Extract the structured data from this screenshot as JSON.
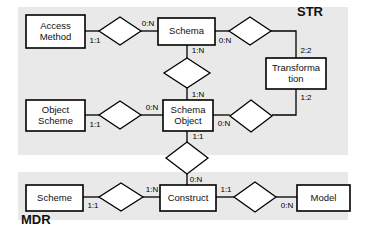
{
  "diagram": {
    "regions": [
      {
        "id": "str",
        "label": "STR",
        "label_x": 297,
        "label_y": 13,
        "x": 18,
        "y": 7,
        "w": 330,
        "h": 148
      },
      {
        "id": "mdr",
        "label": "MDR",
        "label_x": 21,
        "label_y": 221,
        "x": 18,
        "y": 172,
        "w": 330,
        "h": 48
      }
    ],
    "entities": [
      {
        "id": "access-method",
        "lines": [
          "Access",
          "Method"
        ],
        "x": 26,
        "y": 15,
        "w": 59,
        "h": 33
      },
      {
        "id": "schema",
        "lines": [
          "Schema"
        ],
        "x": 158,
        "y": 18,
        "w": 57,
        "h": 27
      },
      {
        "id": "transformation",
        "lines": [
          "Transforma",
          "tion"
        ],
        "x": 266,
        "y": 58,
        "w": 60,
        "h": 31
      },
      {
        "id": "object-scheme",
        "lines": [
          "Object",
          "Scheme"
        ],
        "x": 26,
        "y": 100,
        "w": 59,
        "h": 31
      },
      {
        "id": "schema-object",
        "lines": [
          "Schema",
          "Object"
        ],
        "x": 163,
        "y": 100,
        "w": 50,
        "h": 31
      },
      {
        "id": "scheme",
        "lines": [
          "Scheme"
        ],
        "x": 26,
        "y": 185,
        "w": 57,
        "h": 26
      },
      {
        "id": "construct",
        "lines": [
          "Construct"
        ],
        "x": 160,
        "y": 185,
        "w": 56,
        "h": 26
      },
      {
        "id": "model",
        "lines": [
          "Model"
        ],
        "x": 297,
        "y": 185,
        "w": 53,
        "h": 26
      }
    ],
    "relationships": [
      {
        "id": "access-method-schema",
        "cx": 120,
        "cy": 31,
        "rx": 21,
        "ry": 14
      },
      {
        "id": "schema-transformation",
        "cx": 250,
        "cy": 31,
        "rx": 21,
        "ry": 14
      },
      {
        "id": "schema-schema-object",
        "cx": 187,
        "cy": 73,
        "rx": 23,
        "ry": 15
      },
      {
        "id": "object-scheme-schema-object",
        "cx": 120,
        "cy": 115,
        "rx": 21,
        "ry": 14
      },
      {
        "id": "schema-object-transformation",
        "cx": 251,
        "cy": 116,
        "rx": 21,
        "ry": 16
      },
      {
        "id": "schema-object-construct",
        "cx": 187,
        "cy": 158,
        "rx": 21,
        "ry": 16
      },
      {
        "id": "scheme-construct",
        "cx": 121,
        "cy": 197,
        "rx": 22,
        "ry": 14
      },
      {
        "id": "construct-model",
        "cx": 255,
        "cy": 197,
        "rx": 21,
        "ry": 15
      }
    ],
    "edges": [
      {
        "id": "e-access-method-rel",
        "points": "85,31 99,31"
      },
      {
        "id": "e-rel-schema",
        "points": "141,31 158,31"
      },
      {
        "id": "e-schema-rel-trans",
        "points": "215,31 229,31"
      },
      {
        "id": "e-rel-trans-corner",
        "points": "271,31 296,31 296,58"
      },
      {
        "id": "e-schema-down",
        "points": "187,45 187,58"
      },
      {
        "id": "e-down-schema-object",
        "points": "187,88 187,100"
      },
      {
        "id": "e-object-scheme-rel",
        "points": "85,115 99,115"
      },
      {
        "id": "e-rel-schema-object",
        "points": "141,115 163,115"
      },
      {
        "id": "e-schema-object-rel-r",
        "points": "213,115 230,115"
      },
      {
        "id": "e-rel-r-trans-corner",
        "points": "272,115 296,115 296,89"
      },
      {
        "id": "e-schema-object-down",
        "points": "187,131 187,142"
      },
      {
        "id": "e-down-construct",
        "points": "187,174 187,185"
      },
      {
        "id": "e-scheme-rel",
        "points": "83,197 99,197"
      },
      {
        "id": "e-rel-construct",
        "points": "143,197 160,197"
      },
      {
        "id": "e-construct-rel-model",
        "points": "216,197 234,197"
      },
      {
        "id": "e-rel-model",
        "points": "276,197 297,197"
      }
    ],
    "cardinalities": [
      {
        "id": "card-access-method",
        "text": "1:1",
        "x": 95,
        "y": 41
      },
      {
        "id": "card-schema-left",
        "text": "0:N",
        "x": 148,
        "y": 24
      },
      {
        "id": "card-schema-right",
        "text": "0:N",
        "x": 225,
        "y": 41
      },
      {
        "id": "card-transformation-top",
        "text": "2:2",
        "x": 306,
        "y": 51
      },
      {
        "id": "card-schema-down",
        "text": "1:N",
        "x": 198,
        "y": 51
      },
      {
        "id": "card-schema-object-up",
        "text": "1:N",
        "x": 198,
        "y": 95
      },
      {
        "id": "card-object-scheme",
        "text": "1:1",
        "x": 95,
        "y": 125
      },
      {
        "id": "card-schema-object-left",
        "text": "0:N",
        "x": 152,
        "y": 108
      },
      {
        "id": "card-schema-object-right",
        "text": "0:N",
        "x": 224,
        "y": 124
      },
      {
        "id": "card-transformation-bottom",
        "text": "1:2",
        "x": 306,
        "y": 98
      },
      {
        "id": "card-schema-object-down",
        "text": "1:1",
        "x": 198,
        "y": 137
      },
      {
        "id": "card-construct-up",
        "text": "0:N",
        "x": 196,
        "y": 180
      },
      {
        "id": "card-scheme",
        "text": "1:1",
        "x": 93,
        "y": 206
      },
      {
        "id": "card-construct-left",
        "text": "1:N",
        "x": 152,
        "y": 190
      },
      {
        "id": "card-construct-right",
        "text": "1:1",
        "x": 226,
        "y": 190
      },
      {
        "id": "card-model",
        "text": "0:N",
        "x": 287,
        "y": 206
      }
    ]
  }
}
